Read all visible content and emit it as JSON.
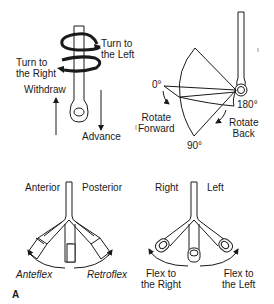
{
  "figure": {
    "panel_label": "A",
    "top_left": {
      "title": "Endoscope shaft movements",
      "labels": {
        "turn_left": [
          "Turn to",
          "the Left"
        ],
        "turn_right": [
          "Turn to",
          "the Right"
        ],
        "withdraw": "Withdraw",
        "advance": "Advance"
      }
    },
    "top_right": {
      "title": "Tip rotation",
      "labels": {
        "deg0": "0°",
        "deg90": "90°",
        "deg180": "180°",
        "rotate_forward": [
          "Rotate",
          "Forward"
        ],
        "rotate_back": [
          "Rotate",
          "Back"
        ]
      }
    },
    "bottom_left": {
      "title": "Anterior/posterior flexion",
      "labels": {
        "anterior": "Anterior",
        "posterior": "Posterior",
        "anteflex": "Anteflex",
        "retroflex": "Retroflex"
      }
    },
    "bottom_right": {
      "title": "Lateral flexion",
      "labels": {
        "right": "Right",
        "left": "Left",
        "flex_right": [
          "Flex to",
          "the Right"
        ],
        "flex_left": [
          "Flex to",
          "the Left"
        ]
      }
    }
  },
  "colors": {
    "line": "#1a1a1a",
    "background": "#ffffff"
  }
}
